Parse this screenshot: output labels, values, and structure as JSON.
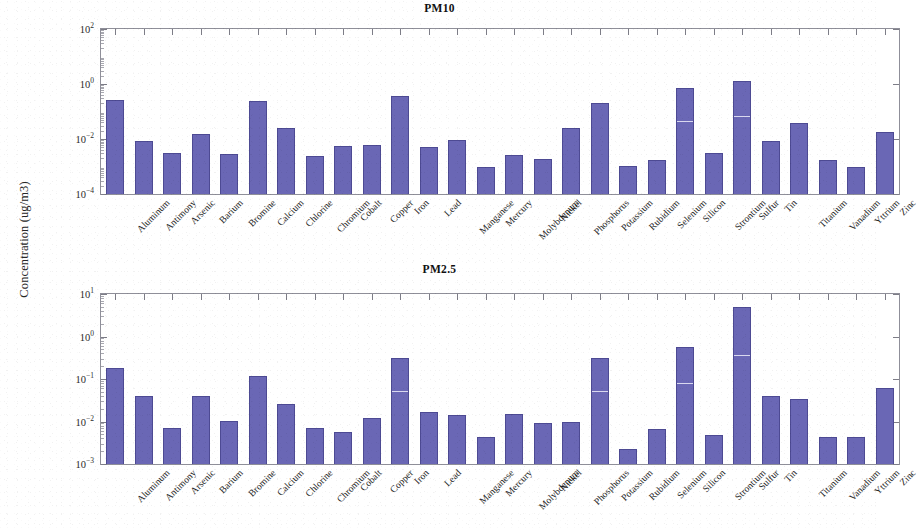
{
  "figure": {
    "ylabel": "Concentration (ug/m3)",
    "bar_color": "#6a67b5",
    "bar_edge_color": "#4d4a93",
    "axis_color": "#8f8f99"
  },
  "panels": [
    {
      "id": "pm10",
      "title": "PM10"
    },
    {
      "id": "pm25",
      "title": "PM2.5"
    }
  ],
  "chart_data": [
    {
      "type": "bar",
      "title": "PM10",
      "xlabel": "",
      "ylabel": "Concentration (ug/m3)",
      "yscale": "log",
      "ylim": [
        0.0001,
        100
      ],
      "ytick_labels": [
        "10-4",
        "10-2",
        "100",
        "102"
      ],
      "ytick_values": [
        0.0001,
        0.01,
        1,
        100
      ],
      "grid": false,
      "legend": null,
      "categories": [
        "Aluminum",
        "Antimony",
        "Arsenic",
        "Barium",
        "Bromine",
        "Calcium",
        "Chlorine",
        "Chromium",
        "Cobalt",
        "Copper",
        "Iron",
        "Lead",
        "Manganese",
        "Mercury",
        "Molybdenum",
        "Nickel",
        "Phosphorus",
        "Potassium",
        "Rubidium",
        "Selenium",
        "Silicon",
        "Strontium",
        "Sulfur",
        "Tin",
        "Titanium",
        "Vanadium",
        "Yttrium",
        "Zinc"
      ],
      "values": [
        0.26,
        0.0084,
        0.0032,
        0.015,
        0.0028,
        0.25,
        0.025,
        0.0024,
        0.0058,
        0.0062,
        0.36,
        0.0051,
        0.0095,
        0.00095,
        0.0026,
        0.0019,
        0.025,
        0.21,
        0.00105,
        0.0017,
        0.72,
        0.0032,
        1.25,
        0.0082,
        0.037,
        0.0017,
        0.00098,
        0.018
      ]
    },
    {
      "type": "bar",
      "title": "PM2.5",
      "xlabel": "",
      "ylabel": "Concentration (ug/m3)",
      "yscale": "log",
      "ylim": [
        0.001,
        10
      ],
      "ytick_labels": [
        "10-3",
        "10-2",
        "10-1",
        "100",
        "101"
      ],
      "ytick_values": [
        0.001,
        0.01,
        0.1,
        1,
        10
      ],
      "grid": false,
      "legend": null,
      "categories": [
        "Aluminum",
        "Antimony",
        "Arsenic",
        "Barium",
        "Bromine",
        "Calcium",
        "Chlorine",
        "Chromium",
        "Cobalt",
        "Copper",
        "Iron",
        "Lead",
        "Manganese",
        "Mercury",
        "Molybdenum",
        "Nickel",
        "Phosphorus",
        "Potassium",
        "Rubidium",
        "Selenium",
        "Silicon",
        "Strontium",
        "Sulfur",
        "Tin",
        "Titanium",
        "Vanadium",
        "Yttrium",
        "Zinc"
      ],
      "values": [
        0.18,
        0.04,
        0.0072,
        0.04,
        0.0102,
        0.115,
        0.026,
        0.0071,
        0.0058,
        0.0122,
        0.31,
        0.017,
        0.014,
        0.0043,
        0.0148,
        0.0093,
        0.0095,
        0.31,
        0.0023,
        0.0066,
        0.57,
        0.0047,
        4.9,
        0.04,
        0.034,
        0.0043,
        0.0043,
        0.063
      ]
    }
  ]
}
